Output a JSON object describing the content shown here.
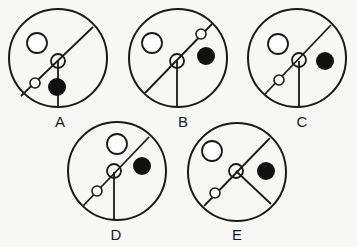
{
  "colors": {
    "background": "#f7f7f5",
    "stroke": "#1a1a1a",
    "fill_black": "#111111"
  },
  "options": [
    {
      "label": "A",
      "circle": {
        "cx": 58,
        "cy": 58,
        "r": 49
      },
      "diagonal": {
        "x1": 93,
        "y1": 27,
        "x2": 21,
        "y2": 96
      },
      "spoke": {
        "x1": 58,
        "y1": 61,
        "x2": 58,
        "y2": 107
      },
      "large_open": {
        "cx": 37,
        "cy": 43,
        "r": 10
      },
      "medium_open": {
        "cx": 58,
        "cy": 61,
        "r": 7
      },
      "small_open": {
        "cx": 35,
        "cy": 83,
        "r": 5
      },
      "black_dot": {
        "cx": 57,
        "cy": 87,
        "r": 9
      },
      "label_pos": {
        "x": 60,
        "y": 127
      }
    },
    {
      "label": "B",
      "circle": {
        "cx": 178,
        "cy": 58,
        "r": 49
      },
      "diagonal": {
        "x1": 212,
        "y1": 24,
        "x2": 145,
        "y2": 93
      },
      "spoke": {
        "x1": 177,
        "y1": 61,
        "x2": 177,
        "y2": 107
      },
      "large_open": {
        "cx": 152,
        "cy": 43,
        "r": 10
      },
      "medium_open": {
        "cx": 177,
        "cy": 61,
        "r": 7
      },
      "small_open": {
        "cx": 201,
        "cy": 34,
        "r": 5
      },
      "black_dot": {
        "cx": 206,
        "cy": 56,
        "r": 9
      },
      "label_pos": {
        "x": 183,
        "y": 127
      }
    },
    {
      "label": "C",
      "circle": {
        "cx": 297,
        "cy": 58,
        "r": 49
      },
      "diagonal": {
        "x1": 331,
        "y1": 25,
        "x2": 265,
        "y2": 94
      },
      "spoke": {
        "x1": 299,
        "y1": 61,
        "x2": 299,
        "y2": 107
      },
      "large_open": {
        "cx": 278,
        "cy": 44,
        "r": 10
      },
      "medium_open": {
        "cx": 299,
        "cy": 60,
        "r": 7
      },
      "small_open": {
        "cx": 279,
        "cy": 80,
        "r": 5
      },
      "black_dot": {
        "cx": 325,
        "cy": 61,
        "r": 9
      },
      "label_pos": {
        "x": 302,
        "y": 127
      }
    },
    {
      "label": "D",
      "circle": {
        "cx": 117,
        "cy": 171,
        "r": 49
      },
      "diagonal": {
        "x1": 149,
        "y1": 137,
        "x2": 83,
        "y2": 206
      },
      "spoke": {
        "x1": 114,
        "y1": 172,
        "x2": 114,
        "y2": 220
      },
      "large_open": {
        "cx": 117,
        "cy": 144,
        "r": 10
      },
      "medium_open": {
        "cx": 114,
        "cy": 171,
        "r": 7
      },
      "small_open": {
        "cx": 97,
        "cy": 191,
        "r": 5
      },
      "black_dot": {
        "cx": 142,
        "cy": 166,
        "r": 9
      },
      "label_pos": {
        "x": 116,
        "y": 240
      }
    },
    {
      "label": "E",
      "circle": {
        "cx": 237,
        "cy": 172,
        "r": 49
      },
      "diagonal": {
        "x1": 270,
        "y1": 138,
        "x2": 204,
        "y2": 206
      },
      "spoke": {
        "x1": 236,
        "y1": 171,
        "x2": 271,
        "y2": 204
      },
      "large_open": {
        "cx": 212,
        "cy": 151,
        "r": 10
      },
      "medium_open": {
        "cx": 236,
        "cy": 171,
        "r": 7
      },
      "small_open": {
        "cx": 215,
        "cy": 193,
        "r": 5
      },
      "black_dot": {
        "cx": 266,
        "cy": 171,
        "r": 9
      },
      "label_pos": {
        "x": 237,
        "y": 240
      }
    }
  ]
}
